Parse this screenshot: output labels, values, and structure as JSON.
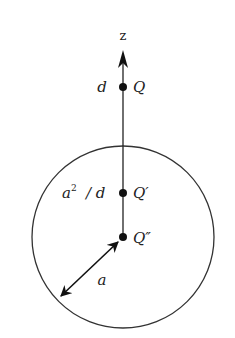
{
  "diagram": {
    "type": "image-charge-sphere",
    "axis": {
      "label": "z"
    },
    "sphere": {
      "radius_label": "a"
    },
    "charges": [
      {
        "name": "Q",
        "position_label": "d"
      },
      {
        "name": "Q′",
        "position_label": "a² / d"
      },
      {
        "name": "Q″",
        "position_label": ""
      }
    ],
    "labels": {
      "z": "z",
      "d": "d",
      "Q": "Q",
      "a2": "a",
      "a2_sup": "2",
      "over_d": "/ d",
      "Qprime": "Q′",
      "Qdprime": "Q″",
      "a": "a"
    },
    "colors": {
      "stroke": "#222222",
      "background": "#ffffff"
    }
  }
}
